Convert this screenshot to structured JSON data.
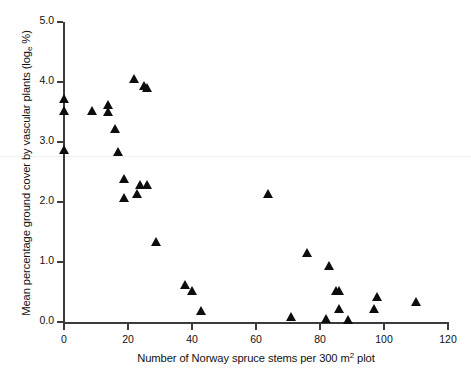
{
  "chart_data": {
    "type": "scatter",
    "title": "",
    "xlabel": "Number of Norway spruce stems per 300 m2 plot",
    "xlabel_parts": {
      "before": "Number of Norway spruce stems per 300 m",
      "sup": "2",
      "after": " plot"
    },
    "ylabel": "Mean percentage ground cover by vascular plants (loge %)",
    "ylabel_parts": {
      "before": "Mean percentage ground cover by vascular plants (log",
      "sub": "e",
      "after": " %)"
    },
    "xlim": [
      0,
      120
    ],
    "ylim": [
      0.0,
      5.0
    ],
    "xticks": [
      0,
      20,
      40,
      60,
      80,
      100,
      120
    ],
    "xtick_labels": [
      "0",
      "20",
      "40",
      "60",
      "80",
      "100",
      "120"
    ],
    "yticks": [
      0.0,
      1.0,
      2.0,
      3.0,
      4.0,
      5.0
    ],
    "ytick_labels": [
      "0.0",
      "1.0",
      "2.0",
      "3.0",
      "4.0",
      "5.0"
    ],
    "grid": false,
    "legend": null,
    "marker": "triangle-up",
    "marker_color": "#0d0d0d",
    "points": [
      {
        "x": 0,
        "y": 3.72
      },
      {
        "x": 0,
        "y": 3.52
      },
      {
        "x": 0,
        "y": 2.87
      },
      {
        "x": 9,
        "y": 3.52
      },
      {
        "x": 14,
        "y": 3.62
      },
      {
        "x": 14,
        "y": 3.5
      },
      {
        "x": 16,
        "y": 3.22
      },
      {
        "x": 17,
        "y": 2.84
      },
      {
        "x": 19,
        "y": 2.38
      },
      {
        "x": 19,
        "y": 2.06
      },
      {
        "x": 22,
        "y": 4.05
      },
      {
        "x": 23,
        "y": 2.13
      },
      {
        "x": 24,
        "y": 2.28
      },
      {
        "x": 25,
        "y": 3.93
      },
      {
        "x": 26,
        "y": 3.9
      },
      {
        "x": 26,
        "y": 2.28
      },
      {
        "x": 29,
        "y": 1.33
      },
      {
        "x": 38,
        "y": 0.61
      },
      {
        "x": 40,
        "y": 0.52
      },
      {
        "x": 43,
        "y": 0.18
      },
      {
        "x": 64,
        "y": 2.13
      },
      {
        "x": 71,
        "y": 0.09
      },
      {
        "x": 76,
        "y": 1.15
      },
      {
        "x": 82,
        "y": 0.05
      },
      {
        "x": 83,
        "y": 0.93
      },
      {
        "x": 85,
        "y": 0.52
      },
      {
        "x": 86,
        "y": 0.52
      },
      {
        "x": 86,
        "y": 0.22
      },
      {
        "x": 89,
        "y": 0.03
      },
      {
        "x": 97,
        "y": 0.21
      },
      {
        "x": 98,
        "y": 0.42
      },
      {
        "x": 110,
        "y": 0.33
      }
    ]
  }
}
